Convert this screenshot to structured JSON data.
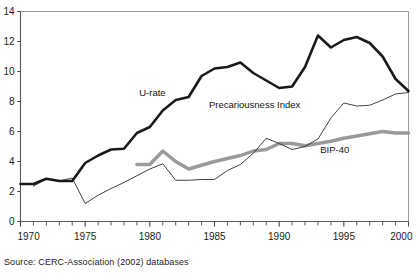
{
  "figure": {
    "source_note": "Source: CERC-Association (2002) databases",
    "title_fragment": ""
  },
  "chart_data": {
    "type": "line",
    "title": "",
    "xlabel": "",
    "ylabel": "",
    "xlim": [
      1970,
      2000
    ],
    "ylim": [
      0,
      14
    ],
    "ytick_labels": [
      "0",
      "2",
      "4",
      "6",
      "8",
      "10",
      "12",
      "14"
    ],
    "yticks": [
      0,
      2,
      4,
      6,
      8,
      10,
      12,
      14
    ],
    "xtick_labels": [
      "1970",
      "1975",
      "1980",
      "1985",
      "1990",
      "1995",
      "2000"
    ],
    "xticks": [
      1970,
      1975,
      1980,
      1985,
      1990,
      1995,
      2000
    ],
    "minor_xticks_every": 1,
    "grid": false,
    "legend_position": "inline-annotations",
    "x": [
      1970,
      1971,
      1972,
      1973,
      1974,
      1975,
      1976,
      1977,
      1978,
      1979,
      1980,
      1981,
      1982,
      1983,
      1984,
      1985,
      1986,
      1987,
      1988,
      1989,
      1990,
      1991,
      1992,
      1993,
      1994,
      1995,
      1996,
      1997,
      1998,
      1999,
      2000
    ],
    "series": [
      {
        "name": "U-rate",
        "label": "U-rate",
        "color": "#1a1a1a",
        "width": 2.6,
        "label_x": 1980.2,
        "label_y": 8.35,
        "values": [
          2.5,
          2.5,
          2.85,
          2.7,
          2.7,
          3.9,
          4.4,
          4.8,
          4.85,
          5.9,
          6.3,
          7.4,
          8.1,
          8.3,
          9.7,
          10.2,
          10.3,
          10.6,
          9.9,
          9.4,
          8.9,
          9.0,
          10.3,
          12.4,
          11.6,
          12.1,
          12.3,
          11.9,
          11.0,
          9.5,
          8.7
        ]
      },
      {
        "name": "Precariousness Index",
        "label": "Precariousness Index",
        "color": "#2b2b2b",
        "width": 0.9,
        "label_x": 1988.1,
        "label_y": 7.55,
        "values": [
          null,
          2.35,
          2.85,
          2.7,
          2.9,
          1.2,
          1.75,
          2.2,
          2.6,
          3.05,
          3.5,
          3.85,
          2.75,
          2.75,
          2.8,
          2.8,
          3.4,
          3.8,
          4.55,
          5.55,
          5.2,
          4.8,
          5.0,
          5.5,
          6.9,
          7.9,
          7.7,
          7.75,
          8.1,
          8.5,
          8.6
        ]
      },
      {
        "name": "BIP-40",
        "label": "BIP-40",
        "color": "#9a9a9a",
        "width": 3.4,
        "label_x": 1994.3,
        "label_y": 4.55,
        "values": [
          null,
          null,
          null,
          null,
          null,
          null,
          null,
          null,
          null,
          3.8,
          3.8,
          4.7,
          4.0,
          3.5,
          3.75,
          4.0,
          4.2,
          4.4,
          4.7,
          4.8,
          5.2,
          5.2,
          5.05,
          5.2,
          5.35,
          5.55,
          5.7,
          5.85,
          6.0,
          5.9,
          5.9
        ]
      }
    ]
  }
}
